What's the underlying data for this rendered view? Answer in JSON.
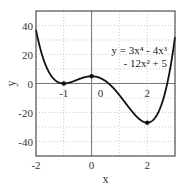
{
  "chart_data": {
    "type": "line",
    "title": "",
    "xlabel": "x",
    "ylabel": "y",
    "xlim": [
      -2,
      3
    ],
    "ylim": [
      -50,
      50
    ],
    "grid": true,
    "x_ticks": [
      -2,
      0,
      2
    ],
    "x_tick_labels": [
      "-2",
      "0",
      "2"
    ],
    "y_ticks": [
      -40,
      -20,
      0,
      20,
      40
    ],
    "y_tick_labels": [
      "-40",
      "-20",
      "0",
      "20",
      "40"
    ],
    "series": [
      {
        "name": "y = 3x^4 - 4x^3 - 12x^2 + 5",
        "function": "3x^4 - 4x^3 - 12x^2 + 5",
        "x": [
          -2,
          -1.5,
          -1,
          -0.5,
          0,
          0.5,
          1,
          1.5,
          2,
          2.5,
          3
        ],
        "values": [
          37,
          5.19,
          0,
          3.19,
          5,
          1.44,
          -8,
          -16.56,
          -27,
          -6.06,
          32
        ]
      }
    ],
    "critical_points": [
      {
        "x": -1,
        "y": 0,
        "label": "-1"
      },
      {
        "x": 0,
        "y": 5,
        "label": "0"
      },
      {
        "x": 2,
        "y": -27,
        "label": "2"
      }
    ],
    "annotation": {
      "line1": "y = 3x⁴ - 4x³",
      "line2": "- 12x² + 5"
    }
  }
}
